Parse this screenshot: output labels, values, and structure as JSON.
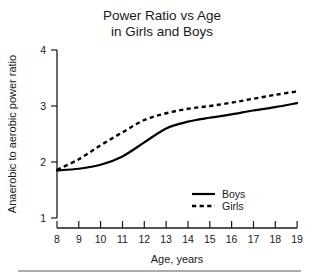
{
  "chart_data": {
    "type": "line",
    "title": "Power Ratio vs Age\nin Girls and Boys",
    "title_line1": "Power Ratio vs Age",
    "title_line2": "in Girls and Boys",
    "xlabel": "Age, years",
    "ylabel": "Anaerobic to aerobic power ratio",
    "xlim": [
      8,
      19
    ],
    "ylim": [
      1,
      4
    ],
    "xticks": [
      8,
      9,
      10,
      11,
      12,
      13,
      14,
      15,
      16,
      17,
      18,
      19
    ],
    "xticklabels": [
      "8",
      "9",
      "10",
      "11",
      "12",
      "13",
      "14",
      "15",
      "16",
      "17",
      "18",
      "19"
    ],
    "yticks": [
      1,
      2,
      3,
      4
    ],
    "yticklabels": [
      "1",
      "2",
      "3",
      "4"
    ],
    "grid": false,
    "legend_position": "lower right",
    "x": [
      8,
      9,
      10,
      11,
      12,
      13,
      14,
      15,
      16,
      17,
      18,
      19
    ],
    "series": [
      {
        "name": "Boys",
        "style": "solid",
        "color": "#000000",
        "values": [
          1.85,
          1.88,
          1.95,
          2.1,
          2.35,
          2.6,
          2.72,
          2.79,
          2.85,
          2.92,
          2.98,
          3.05
        ]
      },
      {
        "name": "Girls",
        "style": "dashed",
        "color": "#000000",
        "values": [
          1.86,
          2.05,
          2.3,
          2.53,
          2.75,
          2.87,
          2.95,
          3.0,
          3.06,
          3.13,
          3.2,
          3.26
        ]
      }
    ]
  },
  "legend": {
    "items": [
      {
        "label": "Boys",
        "style": "solid"
      },
      {
        "label": "Girls",
        "style": "dashed"
      }
    ]
  },
  "colors": {
    "ink": "#1a1a1a",
    "line": "#000000",
    "rule": "#5a5a5a",
    "background": "#ffffff"
  }
}
